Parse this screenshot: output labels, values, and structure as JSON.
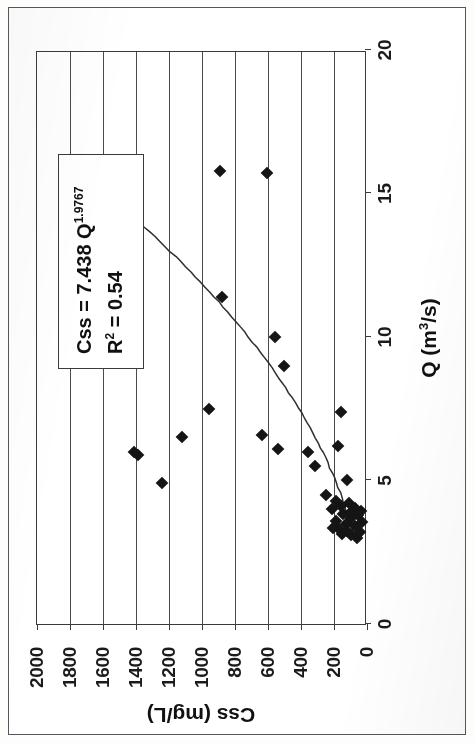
{
  "figure": {
    "kind": "scanned-scatter-plot",
    "rotation_note": "chart printed rotated 90 degrees counter-clockwise on the page"
  },
  "annotation": {
    "equation_prefix": "Css = 7.438 Q",
    "equation_exponent": "1.9767",
    "r2_prefix": "R",
    "r2_superscript": "2",
    "r2_value": " = 0.54"
  },
  "axis_titles": {
    "x_prefix": "Q (m",
    "x_superscript": "3",
    "x_suffix": "/s)",
    "y": "Css (mg/L)"
  },
  "chart_data": {
    "type": "scatter",
    "title": "",
    "xlabel": "Q (m3/s)",
    "ylabel": "Css (mg/L)",
    "xlim": [
      0,
      20
    ],
    "ylim": [
      0,
      2000
    ],
    "xticks": [
      0,
      5,
      10,
      15,
      20
    ],
    "yticks": [
      0,
      200,
      400,
      600,
      800,
      1000,
      1200,
      1400,
      1600,
      1800,
      2000
    ],
    "xtick_labels": [
      "0",
      "5",
      "10",
      "15",
      "20"
    ],
    "ytick_labels": [
      "0",
      "200",
      "400",
      "600",
      "800",
      "1000",
      "1200",
      "1400",
      "1600",
      "1800",
      "2000"
    ],
    "grid": "horizontal-only",
    "legend": "none",
    "series": [
      {
        "name": "Css observations",
        "marker": "filled-diamond",
        "color": "#151515",
        "points": [
          [
            3.0,
            60
          ],
          [
            3.1,
            95
          ],
          [
            3.15,
            150
          ],
          [
            3.2,
            40
          ],
          [
            3.25,
            120
          ],
          [
            3.3,
            170
          ],
          [
            3.35,
            205
          ],
          [
            3.4,
            75
          ],
          [
            3.5,
            130
          ],
          [
            3.55,
            30
          ],
          [
            3.6,
            185
          ],
          [
            3.7,
            95
          ],
          [
            3.8,
            55
          ],
          [
            3.85,
            145
          ],
          [
            3.9,
            100
          ],
          [
            3.95,
            35
          ],
          [
            4.0,
            215
          ],
          [
            4.05,
            70
          ],
          [
            4.1,
            160
          ],
          [
            4.2,
            110
          ],
          [
            4.3,
            185
          ],
          [
            4.5,
            250
          ],
          [
            4.9,
            1240
          ],
          [
            5.0,
            120
          ],
          [
            5.5,
            315
          ],
          [
            5.9,
            1390
          ],
          [
            6.0,
            1410
          ],
          [
            6.0,
            355
          ],
          [
            6.1,
            540
          ],
          [
            6.2,
            175
          ],
          [
            6.5,
            1120
          ],
          [
            6.6,
            635
          ],
          [
            7.4,
            155
          ],
          [
            7.5,
            955
          ],
          [
            9.0,
            505
          ],
          [
            10.0,
            560
          ],
          [
            11.4,
            880
          ],
          [
            15.7,
            605
          ],
          [
            15.8,
            890
          ]
        ]
      }
    ],
    "trendline": {
      "name": "power fit",
      "equation": "Css = 7.438 Q^1.9767",
      "r_squared": 0.54,
      "color": "#2e2e30",
      "x_start": 3.0,
      "x_end": 15.3,
      "y_start": 60,
      "y_end": 1720
    }
  }
}
